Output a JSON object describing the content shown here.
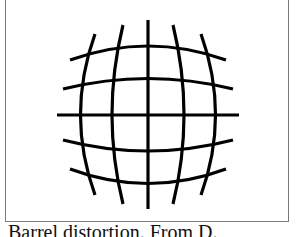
{
  "figure": {
    "line_color": "#000000",
    "frame_color": "#7a7a7a",
    "caption": "Barrel distortion. From D."
  }
}
